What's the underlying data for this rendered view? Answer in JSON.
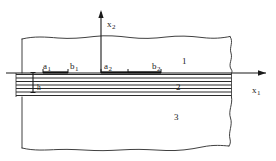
{
  "figure": {
    "type": "technical-diagram",
    "background_color": "#ffffff",
    "line_color": "#1a1a1a",
    "width": 276,
    "height": 161
  },
  "axes": {
    "vertical": {
      "name": "x2-axis",
      "label_base": "x",
      "label_sub": "2",
      "direction": "up",
      "x": 101,
      "y_top": 10,
      "y_bottom": 73
    },
    "horizontal": {
      "name": "x1-axis",
      "label_base": "x",
      "label_sub": "1",
      "direction": "right",
      "y": 73,
      "x_left": 6,
      "x_right": 270
    }
  },
  "regions": [
    {
      "name": "region-1",
      "label": "1",
      "description": "upper half-space"
    },
    {
      "name": "region-2",
      "label": "2",
      "description": "layered band"
    },
    {
      "name": "region-3",
      "label": "3",
      "description": "lower half-space"
    }
  ],
  "interval_labels": [
    {
      "name": "a1",
      "base": "a",
      "sub": "1"
    },
    {
      "name": "b1",
      "base": "b",
      "sub": "1"
    },
    {
      "name": "a2",
      "base": "a",
      "sub": "2"
    },
    {
      "name": "b2",
      "base": "b",
      "sub": "2"
    }
  ],
  "thickness_label": {
    "name": "h",
    "text": "h"
  },
  "layer_band": {
    "name": "layer-band",
    "y_top": 73,
    "y_bottom": 97,
    "line_count": 7
  }
}
